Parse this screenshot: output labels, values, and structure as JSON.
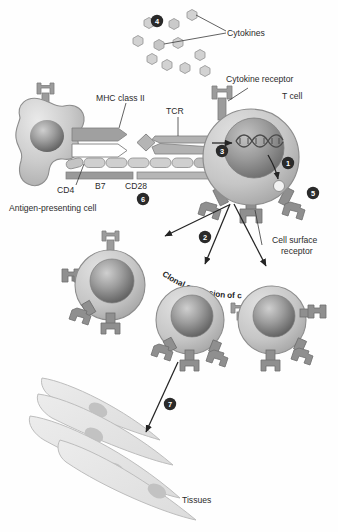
{
  "figure": {
    "background": "#fefefe"
  },
  "labels": {
    "cytokines": "Cytokines",
    "cytokine_receptor": "Cytokine receptor",
    "t_cell": "T cell",
    "mhc_class_ii": "MHC class II",
    "tcr": "TCR",
    "cd4": "CD4",
    "b7": "B7",
    "cd28": "CD28",
    "apc": "Antigen-presenting cell",
    "cell_surface_receptor_line1": "Cell surface",
    "cell_surface_receptor_line2": "receptor",
    "clonal_expansion": "Clonal expansion of cells",
    "tissues": "Tissues"
  },
  "steps": [
    {
      "id": "1",
      "label": "1"
    },
    {
      "id": "2",
      "label": "2"
    },
    {
      "id": "3",
      "label": "3"
    },
    {
      "id": "4",
      "label": "4"
    },
    {
      "id": "5",
      "label": "5"
    },
    {
      "id": "6",
      "label": "6"
    },
    {
      "id": "7",
      "label": "7"
    }
  ],
  "colors": {
    "cell_body": "#c9c9c9",
    "cell_body_light": "#dedede",
    "cell_outline": "#8d8d8d",
    "nucleus": "#9a9a9a",
    "nucleus_dark": "#6f6f6f",
    "receptor": "#8a8a8a",
    "cytokine": "#d2d2d2",
    "cytokine_outline": "#9b9b9b",
    "tissue": "#e4e4e4",
    "tissue_outline": "#bdbdbd",
    "tissue_nucleus": "#c2c2c2",
    "text": "#2b2b2b",
    "marker_fill": "#2a2a2a",
    "arrow": "#242424"
  },
  "cytokine_dots": [
    {
      "x": 149,
      "y": 23
    },
    {
      "x": 174,
      "y": 24
    },
    {
      "x": 192,
      "y": 15
    },
    {
      "x": 138,
      "y": 41
    },
    {
      "x": 159,
      "y": 45
    },
    {
      "x": 178,
      "y": 43
    },
    {
      "x": 152,
      "y": 59
    },
    {
      "x": 167,
      "y": 65
    },
    {
      "x": 200,
      "y": 55
    },
    {
      "x": 185,
      "y": 68
    },
    {
      "x": 205,
      "y": 71
    }
  ],
  "cells": {
    "t_cell_main": {
      "cx": 251,
      "cy": 157,
      "r": 48
    },
    "daughter_left": {
      "cx": 110,
      "cy": 285,
      "r": 35
    },
    "daughter_mid": {
      "cx": 190,
      "cy": 320,
      "r": 34
    },
    "daughter_right": {
      "cx": 272,
      "cy": 320,
      "r": 34
    }
  },
  "tissue_label_position": {
    "x": 182,
    "y": 500
  }
}
